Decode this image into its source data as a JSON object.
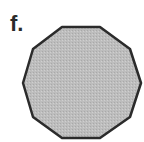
{
  "figure": {
    "label": "f.",
    "shape": {
      "name": "decagon",
      "sides": 10,
      "fill": "#b9b9b9",
      "stroke": "#2b2b2b",
      "points": "62,27 100,27 130,49 141,83 130,117 100,138 62,138 33,117 23,83 33,49"
    }
  }
}
